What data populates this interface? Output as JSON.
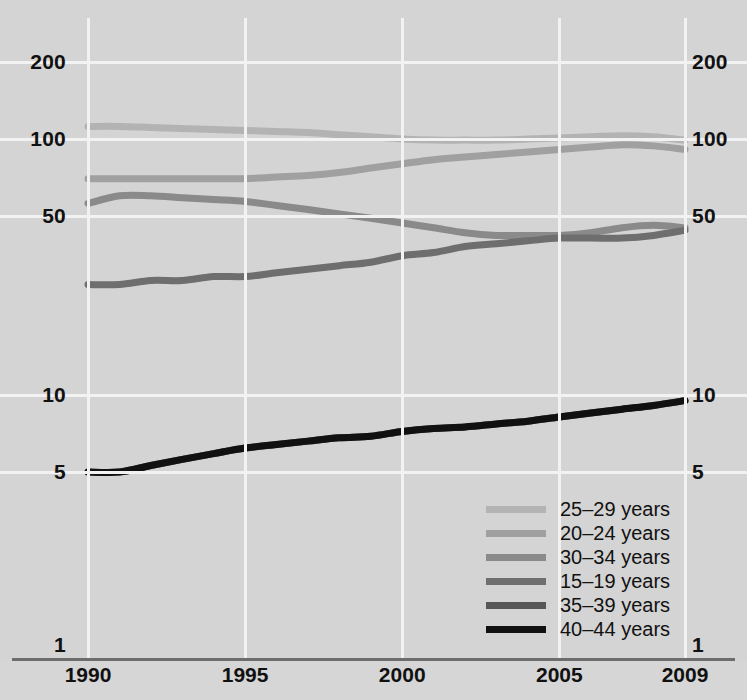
{
  "chart_data": {
    "type": "line",
    "title": "",
    "subtitle": "",
    "xlabel": "",
    "ylabel": "",
    "yscale": "log",
    "ylim": [
      1,
      260
    ],
    "xlim": [
      1990,
      2009
    ],
    "grid": true,
    "legend_position": "bottom-right",
    "y_ticks": [
      {
        "value": 200,
        "label": "200"
      },
      {
        "value": 100,
        "label": "100"
      },
      {
        "value": 50,
        "label": "50"
      },
      {
        "value": 10,
        "label": "10"
      },
      {
        "value": 5,
        "label": "5"
      },
      {
        "value": 1,
        "label": "1"
      }
    ],
    "x_ticks": [
      {
        "value": 1990,
        "label": "1990"
      },
      {
        "value": 1995,
        "label": "1995"
      },
      {
        "value": 2000,
        "label": "2000"
      },
      {
        "value": 2005,
        "label": "2005"
      },
      {
        "value": 2009,
        "label": "2009"
      }
    ],
    "x": [
      1990,
      1991,
      1992,
      1993,
      1994,
      1995,
      1996,
      1997,
      1998,
      1999,
      2000,
      2001,
      2002,
      2003,
      2004,
      2005,
      2006,
      2007,
      2008,
      2009
    ],
    "series": [
      {
        "name": "25–29 years",
        "color": "#b3b3b3",
        "values": [
          112,
          112,
          111,
          110,
          109,
          108,
          107,
          106,
          104,
          102,
          100,
          99,
          99,
          99,
          100,
          101,
          102,
          103,
          102,
          99
        ]
      },
      {
        "name": "20–24 years",
        "color": "#a0a0a0",
        "values": [
          70,
          70,
          70,
          70,
          70,
          70,
          71,
          72,
          74,
          77,
          80,
          83,
          85,
          87,
          89,
          91,
          93,
          95,
          94,
          91
        ]
      },
      {
        "name": "30–34 years",
        "color": "#8a8a8a",
        "values": [
          56,
          60,
          60,
          59,
          58,
          57,
          55,
          53,
          51,
          49,
          47,
          45,
          43,
          42,
          42,
          42,
          43,
          45,
          46,
          45
        ]
      },
      {
        "name": "15–19 years",
        "color": "#6e6e6e",
        "values": [
          27,
          27,
          28,
          28,
          29,
          29,
          30,
          31,
          32,
          33,
          35,
          36,
          38,
          39,
          40,
          41,
          41,
          41,
          42,
          44
        ]
      },
      {
        "name": "35–39 years",
        "color": "#575757",
        "values": [
          5.0,
          5.0,
          5.3,
          5.6,
          5.9,
          6.2,
          6.4,
          6.6,
          6.8,
          6.9,
          7.2,
          7.4,
          7.5,
          7.7,
          7.9,
          8.2,
          8.5,
          8.8,
          9.1,
          9.5
        ]
      },
      {
        "name": "40–44 years",
        "color": "#111111",
        "values": [
          5.0,
          5.0,
          5.3,
          5.6,
          5.9,
          6.2,
          6.4,
          6.6,
          6.8,
          6.9,
          7.2,
          7.4,
          7.5,
          7.7,
          7.9,
          8.2,
          8.5,
          8.8,
          9.1,
          9.5
        ]
      }
    ],
    "legend_entries": [
      {
        "label": "25–29 years",
        "color": "#b3b3b3"
      },
      {
        "label": "20–24 years",
        "color": "#a0a0a0"
      },
      {
        "label": "30–34 years",
        "color": "#8a8a8a"
      },
      {
        "label": "15–19 years",
        "color": "#6e6e6e"
      },
      {
        "label": "35–39 years",
        "color": "#575757"
      },
      {
        "label": "40–44 years",
        "color": "#111111"
      }
    ]
  },
  "axes": {
    "left_labels": [
      "200",
      "100",
      "50",
      "10",
      "5",
      "1"
    ],
    "right_labels": [
      "200",
      "100",
      "50",
      "10",
      "5",
      "1"
    ],
    "x_labels": [
      "1990",
      "1995",
      "2000",
      "2005",
      "2009"
    ]
  },
  "colors": {
    "background": "#d4d4d4",
    "gridline": "#f2f2f2",
    "axis": "#6d6d6d",
    "text": "#111111"
  }
}
